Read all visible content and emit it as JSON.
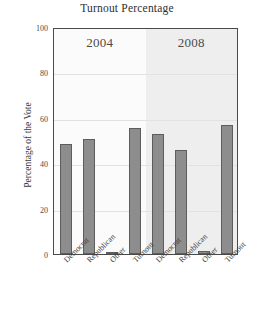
{
  "chart_data": {
    "type": "bar",
    "title": "Turnout Percentage",
    "xlabel": "",
    "ylabel": "Percentage of the Vote",
    "ylim": [
      0,
      100
    ],
    "yticks": [
      0,
      20,
      40,
      60,
      80,
      100
    ],
    "grid": true,
    "legend": "none",
    "panels": [
      {
        "label": "2004",
        "categories": [
          "Democrat",
          "Republican",
          "Other",
          "Turnout"
        ],
        "values": [
          48.3,
          50.7,
          1.0,
          55.7
        ]
      },
      {
        "label": "2008",
        "categories": [
          "Democrat",
          "Republican",
          "Other",
          "Turnout"
        ],
        "values": [
          52.9,
          45.7,
          1.4,
          56.8
        ]
      }
    ],
    "categories": [
      "Democrat",
      "Republican",
      "Other",
      "Turnout",
      "Democrat",
      "Republican",
      "Other",
      "Turnout"
    ],
    "values": [
      48.3,
      50.7,
      1.0,
      55.7,
      52.9,
      45.7,
      1.4,
      56.8
    ],
    "colors": {
      "bar_fill": "#8d8d8d",
      "bar_edge": "#5d5d5d",
      "panel_2004_bg": "#fbfbfb",
      "panel_2008_bg": "#eeeeee",
      "grid": "#e2e2e2",
      "frame": "#4a4a4a"
    }
  }
}
